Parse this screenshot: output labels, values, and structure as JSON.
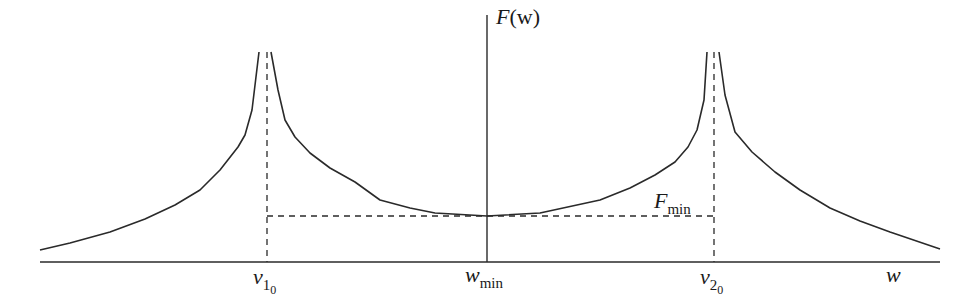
{
  "diagram": {
    "type": "function-plot-sketch",
    "colors": {
      "stroke": "#2a2a2a",
      "background": "#ffffff"
    },
    "axes": {
      "y_axis_label": {
        "main": "F",
        "paren": "(w)"
      },
      "x_axis_label": "w"
    },
    "labels": {
      "v1": {
        "main": "v",
        "sub": "1",
        "subsub": "0"
      },
      "v2": {
        "main": "v",
        "sub": "2",
        "subsub": "0"
      },
      "wmin": {
        "main": "w",
        "sub": "min"
      },
      "fmin": {
        "main": "F",
        "sub": "min"
      }
    },
    "geometry": {
      "baseline_y": 262,
      "x_axis_range_px": [
        40,
        940
      ],
      "y_axis_x": 487,
      "y_axis_top": 15,
      "v1_x": 267,
      "v2_x": 714,
      "fmin_y": 216,
      "peak_top_y": 52
    },
    "curve_segments": [
      {
        "name": "left-outer",
        "points": [
          [
            40,
            250
          ],
          [
            70,
            243
          ],
          [
            110,
            232
          ],
          [
            145,
            219
          ],
          [
            175,
            205
          ],
          [
            200,
            190
          ],
          [
            220,
            170
          ],
          [
            238,
            147
          ],
          [
            245,
            135
          ],
          [
            252,
            110
          ],
          [
            259,
            52
          ]
        ]
      },
      {
        "name": "center",
        "points": [
          [
            271,
            52
          ],
          [
            278,
            90
          ],
          [
            285,
            120
          ],
          [
            295,
            137
          ],
          [
            310,
            153
          ],
          [
            330,
            168
          ],
          [
            355,
            182
          ],
          [
            380,
            200
          ],
          [
            410,
            208
          ],
          [
            435,
            213
          ],
          [
            487,
            216
          ],
          [
            540,
            213
          ],
          [
            600,
            200
          ],
          [
            630,
            188
          ],
          [
            655,
            175
          ],
          [
            675,
            162
          ],
          [
            688,
            147
          ],
          [
            697,
            130
          ],
          [
            704,
            100
          ],
          [
            707,
            52
          ]
        ]
      },
      {
        "name": "right-outer",
        "points": [
          [
            719,
            52
          ],
          [
            725,
            95
          ],
          [
            735,
            132
          ],
          [
            752,
            152
          ],
          [
            775,
            172
          ],
          [
            800,
            190
          ],
          [
            830,
            208
          ],
          [
            860,
            221
          ],
          [
            890,
            232
          ],
          [
            940,
            249
          ]
        ]
      }
    ]
  }
}
